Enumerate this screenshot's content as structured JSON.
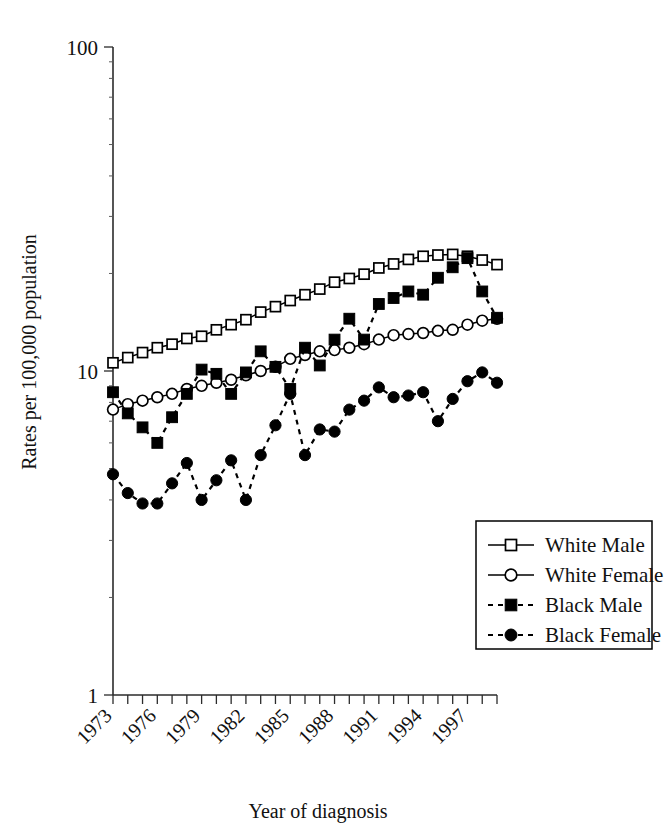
{
  "chart_data": {
    "type": "line",
    "title": "",
    "xlabel": "Year of diagnosis",
    "ylabel": "Rates per 100,000 population",
    "yscale": "log",
    "ylim": [
      1,
      100
    ],
    "ytick_labels": [
      "1",
      "10",
      "100"
    ],
    "ytick_values": [
      1,
      10,
      100
    ],
    "xlim": [
      1973,
      1999
    ],
    "xtick_labels": [
      "1973",
      "1976",
      "1979",
      "1982",
      "1985",
      "1988",
      "1991",
      "1994",
      "1997"
    ],
    "xtick_values": [
      1973,
      1976,
      1979,
      1982,
      1985,
      1988,
      1991,
      1994,
      1997
    ],
    "grid": false,
    "legend_position": "lower-right",
    "x": [
      1973,
      1974,
      1975,
      1976,
      1977,
      1978,
      1979,
      1980,
      1981,
      1982,
      1983,
      1984,
      1985,
      1986,
      1987,
      1988,
      1989,
      1990,
      1991,
      1992,
      1993,
      1994,
      1995,
      1996,
      1997,
      1998,
      1999
    ],
    "series": [
      {
        "name": "White Male",
        "marker": "open-square",
        "line": "solid",
        "color": "#000000",
        "values": [
          10.6,
          11.0,
          11.4,
          11.8,
          12.1,
          12.6,
          12.8,
          13.4,
          13.9,
          14.4,
          15.2,
          15.8,
          16.5,
          17.2,
          17.9,
          18.8,
          19.3,
          19.9,
          20.8,
          21.4,
          22.1,
          22.6,
          22.8,
          22.9,
          22.6,
          22.0,
          21.3
        ]
      },
      {
        "name": "White Female",
        "marker": "open-circle",
        "line": "solid",
        "color": "#000000",
        "values": [
          7.6,
          7.9,
          8.1,
          8.3,
          8.5,
          8.8,
          9.0,
          9.2,
          9.4,
          9.7,
          10.0,
          10.3,
          10.9,
          11.2,
          11.5,
          11.6,
          11.8,
          12.1,
          12.5,
          12.9,
          13.0,
          13.1,
          13.3,
          13.4,
          13.9,
          14.3,
          14.5
        ]
      },
      {
        "name": "Black Male",
        "marker": "filled-square",
        "line": "dashed",
        "color": "#000000",
        "values": [
          8.6,
          7.4,
          6.7,
          6.0,
          7.2,
          8.5,
          10.1,
          9.8,
          8.5,
          9.9,
          11.5,
          10.3,
          8.8,
          11.8,
          10.4,
          12.5,
          14.5,
          12.5,
          16.1,
          16.8,
          17.6,
          17.2,
          19.4,
          20.9,
          22.3,
          17.6,
          14.6
        ]
      },
      {
        "name": "Black Female",
        "marker": "filled-circle",
        "line": "dashed",
        "color": "#000000",
        "values": [
          4.8,
          4.2,
          3.9,
          3.9,
          4.5,
          5.2,
          4.0,
          4.6,
          5.3,
          4.0,
          5.5,
          6.8,
          8.5,
          5.5,
          6.6,
          6.5,
          7.6,
          8.1,
          8.9,
          8.3,
          8.4,
          8.6,
          7.0,
          8.2,
          9.3,
          9.9,
          9.2
        ]
      }
    ],
    "legend_entries": [
      {
        "label": "White Male",
        "marker": "open-square",
        "line": "solid"
      },
      {
        "label": "White Female",
        "marker": "open-circle",
        "line": "solid"
      },
      {
        "label": "Black Male",
        "marker": "filled-square",
        "line": "dashed"
      },
      {
        "label": "Black Female",
        "marker": "filled-circle",
        "line": "dashed"
      }
    ]
  }
}
